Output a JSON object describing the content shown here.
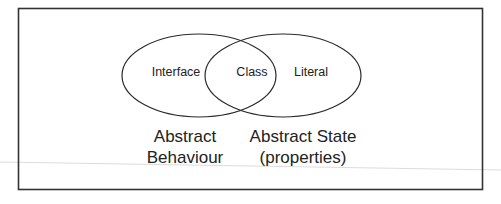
{
  "diagram": {
    "type": "venn",
    "sets": [
      {
        "id": "left",
        "label": "Interface"
      },
      {
        "id": "right",
        "label": "Literal"
      }
    ],
    "intersection": {
      "label": "Class"
    },
    "captions": {
      "left": [
        "Abstract",
        "Behaviour"
      ],
      "right": [
        "Abstract State",
        "(properties)"
      ]
    },
    "colors": {
      "stroke": "#222222",
      "background": "#ffffff",
      "scan_line": "#d8d8d8"
    }
  }
}
